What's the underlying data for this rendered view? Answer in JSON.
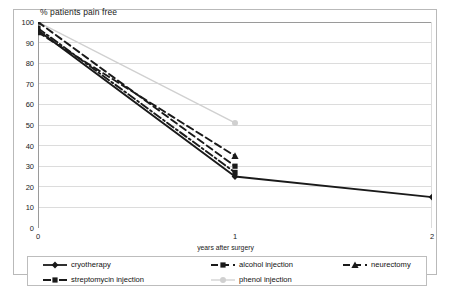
{
  "chart_data": {
    "type": "line",
    "title": "% patients pain free",
    "xlabel": "years after surgery",
    "ylabel": "% patients pain free",
    "xlim": [
      0,
      2
    ],
    "ylim": [
      0,
      100
    ],
    "xticks": [
      "0",
      "1",
      "2"
    ],
    "yticks": [
      "0",
      "10",
      "20",
      "30",
      "40",
      "50",
      "60",
      "70",
      "80",
      "90",
      "100"
    ],
    "grid": "horizontal",
    "legend_position": "bottom",
    "x": [
      0,
      1,
      2
    ],
    "series": [
      {
        "name": "cryotherapy",
        "marker": "diamond",
        "line_style": "solid",
        "color": "#1a1a1a",
        "x": [
          0,
          1,
          2
        ],
        "values": [
          96,
          25,
          15
        ]
      },
      {
        "name": "streptomycin injection",
        "marker": "square",
        "line_style": "dash-dot",
        "color": "#1a1a1a",
        "x": [
          0,
          1
        ],
        "values": [
          97,
          27
        ]
      },
      {
        "name": "alcohol injection",
        "marker": "square",
        "line_style": "dashed",
        "color": "#1a1a1a",
        "x": [
          0,
          1
        ],
        "values": [
          100,
          30
        ]
      },
      {
        "name": "phenol injection",
        "marker": "circle",
        "line_style": "solid",
        "color": "#d0d0d0",
        "x": [
          0,
          1
        ],
        "values": [
          100,
          51
        ]
      },
      {
        "name": "neurectomy",
        "marker": "triangle",
        "line_style": "dashed",
        "color": "#1a1a1a",
        "x": [
          0,
          1
        ],
        "values": [
          95,
          35
        ]
      }
    ]
  },
  "legend": {
    "entries": [
      {
        "label": "cryotherapy"
      },
      {
        "label": "alcohol injection"
      },
      {
        "label": "neurectomy"
      },
      {
        "label": "streptomycin injection"
      },
      {
        "label": "phenol injection"
      }
    ]
  }
}
